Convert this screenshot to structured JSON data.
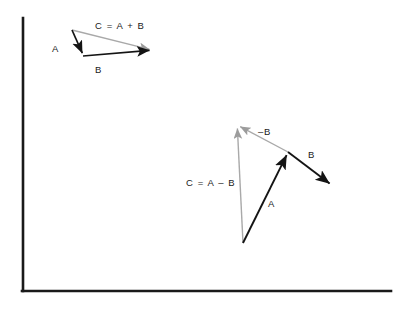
{
  "figure": {
    "background_color": "#ffffff",
    "frame": {
      "name": "axis-frame",
      "color": "#1a1a1a",
      "stroke_width": 2.6,
      "vertical_line": {
        "x": 23,
        "y1": 18,
        "y2": 291
      },
      "horizontal_line": {
        "y": 291,
        "x1": 22,
        "x2": 391
      }
    },
    "colors": {
      "vector_black": "#141414",
      "vector_gray": "#a9a9a9",
      "text": "#1a1a1a"
    }
  },
  "diagrams": [
    {
      "name": "vector-addition",
      "labels": {
        "resultant": "C = A + B",
        "vector_a": "A",
        "vector_b": "B"
      },
      "vectors": [
        {
          "name": "vector-a",
          "label": "A",
          "color": "#141414",
          "from": [
            72,
            30
          ],
          "to": [
            83,
            56
          ],
          "label_pos": [
            56,
            49
          ]
        },
        {
          "name": "vector-b",
          "label": "B",
          "color": "#141414",
          "from": [
            83,
            56
          ],
          "to": [
            152,
            50
          ],
          "label_pos": [
            97,
            70
          ]
        },
        {
          "name": "vector-c-resultant",
          "label": "C = A + B",
          "color": "#a9a9a9",
          "from": [
            72,
            30
          ],
          "to": [
            152,
            50
          ],
          "label_pos": [
            95,
            26
          ]
        }
      ]
    },
    {
      "name": "vector-subtraction",
      "labels": {
        "resultant": "C = A – B",
        "vector_a": "A",
        "vector_b": "B",
        "vector_minus_b": "–B"
      },
      "vectors": [
        {
          "name": "vector-a",
          "label": "A",
          "color": "#141414",
          "from": [
            243,
            243
          ],
          "to": [
            288,
            152
          ],
          "label_pos": [
            270,
            203
          ]
        },
        {
          "name": "vector-b",
          "label": "B",
          "color": "#141414",
          "from": [
            288,
            152
          ],
          "to": [
            332,
            186
          ],
          "label_pos": [
            310,
            155
          ]
        },
        {
          "name": "vector-minus-b",
          "label": "–B",
          "color": "#a9a9a9",
          "from": [
            288,
            152
          ],
          "to": [
            237,
            125
          ],
          "label_pos": [
            260,
            133
          ]
        },
        {
          "name": "vector-c-resultant",
          "label": "C = A – B",
          "color": "#a9a9a9",
          "from": [
            243,
            243
          ],
          "to": [
            237,
            125
          ],
          "label_pos": [
            186,
            183
          ]
        }
      ]
    }
  ]
}
